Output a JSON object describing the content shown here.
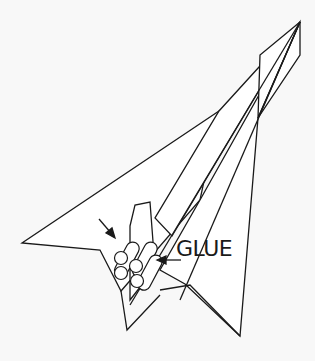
{
  "diagram": {
    "labels": {
      "glue": "GLUE"
    },
    "annotations": [
      {
        "name": "arrow-pointing-to-tubes",
        "text": ""
      },
      {
        "name": "arrow-pointing-to-glue-spot",
        "text": "GLUE"
      }
    ],
    "colors": {
      "background": "#f8f8f8",
      "stroke": "#1a1a1a",
      "fill": "#ffffff"
    }
  }
}
